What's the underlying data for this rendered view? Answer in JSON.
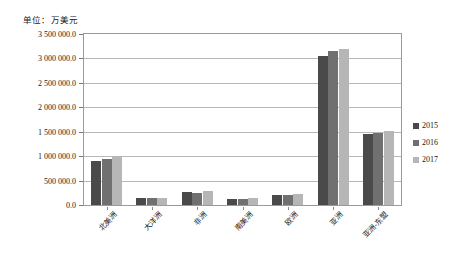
{
  "chart_data": {
    "type": "bar",
    "title": "",
    "subtitle": "",
    "unit_label": "单位：万美元",
    "xlabel": "",
    "ylabel": "",
    "ylim": [
      0,
      3500000
    ],
    "ytick_step": 500000,
    "grid": true,
    "legend_position": "right",
    "categories": [
      "北美洲",
      "大洋洲",
      "非洲",
      "南美洲",
      "欧洲",
      "亚洲",
      "亚洲-东盟"
    ],
    "ytick_labels": [
      "3 500 000.0",
      "3 000 000.0",
      "2 500 000.0",
      "2 000 000.0",
      "1 500 000.0",
      "1 000 000.0",
      "500 000.0",
      "0.0"
    ],
    "ytick_values": [
      3500000,
      3000000,
      2500000,
      2000000,
      1500000,
      1000000,
      500000,
      0
    ],
    "series": [
      {
        "name": "2015",
        "color": "#4a4a4a",
        "values": [
          910000,
          140000,
          265000,
          125000,
          205000,
          3050000,
          1450000
        ]
      },
      {
        "name": "2016",
        "color": "#707070",
        "values": [
          935000,
          140000,
          250000,
          125000,
          210000,
          3150000,
          1475000
        ]
      },
      {
        "name": "2017",
        "color": "#b6b6b6",
        "values": [
          1000000,
          135000,
          295000,
          150000,
          225000,
          3200000,
          1520000
        ]
      }
    ]
  },
  "legend": {
    "items": [
      {
        "label": "2015",
        "color": "#4a4a4a"
      },
      {
        "label": "2016",
        "color": "#707070"
      },
      {
        "label": "2017",
        "color": "#b6b6b6"
      }
    ]
  }
}
